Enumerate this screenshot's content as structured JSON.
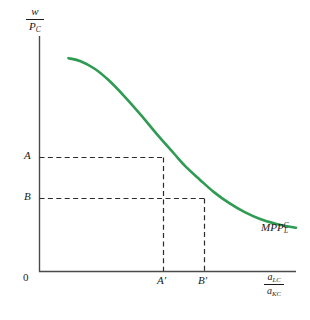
{
  "chart_data": {
    "type": "line",
    "title": "",
    "subtitle": "",
    "xlabel": "a_LC / a_KC",
    "ylabel": "w / P_C",
    "xlabel_numerator": "a",
    "xlabel_numerator_sub": "LC",
    "xlabel_denominator": "a",
    "xlabel_denominator_sub": "KC",
    "ylabel_numerator": "w",
    "ylabel_denominator": "P",
    "ylabel_denominator_sub": "C",
    "grid": false,
    "legend_position": "inline-right",
    "origin_label": "0",
    "xlim": [
      0,
      1
    ],
    "ylim": [
      0,
      1
    ],
    "series": [
      {
        "name": "MPP_L^C",
        "label_base": "MPP",
        "label_sub": "L",
        "label_sup": "C",
        "color": "#2e9b52",
        "points": [
          [
            0.113,
            0.906
          ],
          [
            0.16,
            0.893
          ],
          [
            0.215,
            0.861
          ],
          [
            0.27,
            0.812
          ],
          [
            0.33,
            0.745
          ],
          [
            0.395,
            0.665
          ],
          [
            0.46,
            0.58
          ],
          [
            0.525,
            0.5
          ],
          [
            0.57,
            0.445
          ],
          [
            0.625,
            0.39
          ],
          [
            0.68,
            0.337
          ],
          [
            0.74,
            0.29
          ],
          [
            0.8,
            0.252
          ],
          [
            0.86,
            0.223
          ],
          [
            0.92,
            0.203
          ],
          [
            0.965,
            0.192
          ],
          [
            1.0,
            0.186
          ]
        ]
      }
    ],
    "ytick_labels": [
      "A",
      "B"
    ],
    "ytick_values": [
      0.483,
      0.31
    ],
    "xtick_labels": [
      "A'",
      "B'"
    ],
    "xtick_values": [
      0.484,
      0.645
    ],
    "annotations": [
      {
        "kind": "guide-point",
        "y_label": "A",
        "x_label": "A'",
        "x": 0.484,
        "y": 0.483,
        "style": "dashed"
      },
      {
        "kind": "guide-point",
        "y_label": "B",
        "x_label": "B'",
        "x": 0.645,
        "y": 0.31,
        "style": "dashed"
      }
    ],
    "colors": {
      "curve": "#2e9b52",
      "axis": "#4a4a4a",
      "guide": "#2b2b2b",
      "text": "#1a1a1a",
      "background": "#ffffff"
    }
  }
}
